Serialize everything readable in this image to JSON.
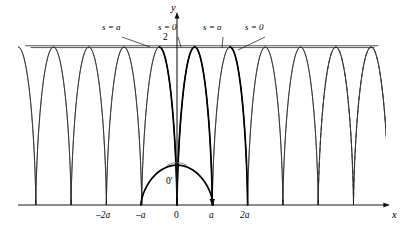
{
  "figure": {
    "background": "#ffffff",
    "stroke_color": "#1a1a1a",
    "bold_stroke_color": "#000000"
  },
  "axes": {
    "x_axis_label": "x",
    "y_axis_label": "y",
    "origin_label": "0",
    "second_origin_label": "0'",
    "y_value_label": "2",
    "x_ticks": [
      {
        "label": "–2a",
        "value": -2
      },
      {
        "label": "–a",
        "value": -1
      },
      {
        "label": "0",
        "value": 0
      },
      {
        "label": "a",
        "value": 1
      },
      {
        "label": "2a",
        "value": 2
      }
    ]
  },
  "annotations": [
    {
      "id": "ann-s-a-left",
      "text": "s = a",
      "x": 102,
      "y": 28,
      "leader_to_x": 150,
      "leader_to_y": 47
    },
    {
      "id": "ann-s-0-left",
      "text": "s = 0",
      "x": 158,
      "y": 28,
      "leader_to_x": 181,
      "leader_to_y": 47
    },
    {
      "id": "ann-s-a-right",
      "text": "s = a",
      "x": 203,
      "y": 28,
      "leader_to_x": 222,
      "leader_to_y": 48
    },
    {
      "id": "ann-s-0-right",
      "text": "s = 0",
      "x": 245,
      "y": 28,
      "leader_to_x": 238,
      "leader_to_y": 50
    }
  ],
  "chart_data": {
    "type": "line",
    "title": "",
    "xlabel": "x",
    "ylabel": "y",
    "xlim": [
      -5.1,
      6.4
    ],
    "ylim": [
      0,
      2.35
    ],
    "grid": false,
    "legend": null,
    "families": [
      {
        "name": "family-right-running",
        "style": "solid-thin",
        "description": "cycloid arcs x = c + (t - sin t), y = 1 - cos t",
        "cusp_positions": [
          -5,
          -4,
          -3,
          -2,
          -1,
          0,
          1,
          2,
          3,
          4,
          5
        ]
      },
      {
        "name": "family-left-running",
        "style": "solid-thin",
        "description": "mirrored cycloid arcs x = c - (t - sin t), y = 1 - cos t",
        "cusp_positions": [
          -5,
          -4,
          -3,
          -2,
          -1,
          0,
          1,
          2,
          3,
          4,
          5,
          6
        ]
      },
      {
        "name": "family-dashed",
        "style": "dashed-thin",
        "description": "two dashed cycloid arcs on the far right",
        "cusp_positions": [
          4,
          5
        ]
      }
    ],
    "bold_curves": [
      {
        "name": "cycloid-s-equals-0-loop",
        "description": "closed teardrop loop centred on the y axis, cusp at origin 0', apex at y = 2"
      },
      {
        "name": "cycloid-s-equals-a-arc",
        "description": "bold cycloid arc from apex near x = a down to the right with an arrowhead"
      },
      {
        "name": "cycloid-base-arc",
        "description": "bold concave-down cycloid arc through the cusp point 0'"
      }
    ],
    "envelope_line": {
      "y": 2,
      "x_from": -4.3,
      "x_to": 5.7,
      "style": "solid"
    }
  }
}
